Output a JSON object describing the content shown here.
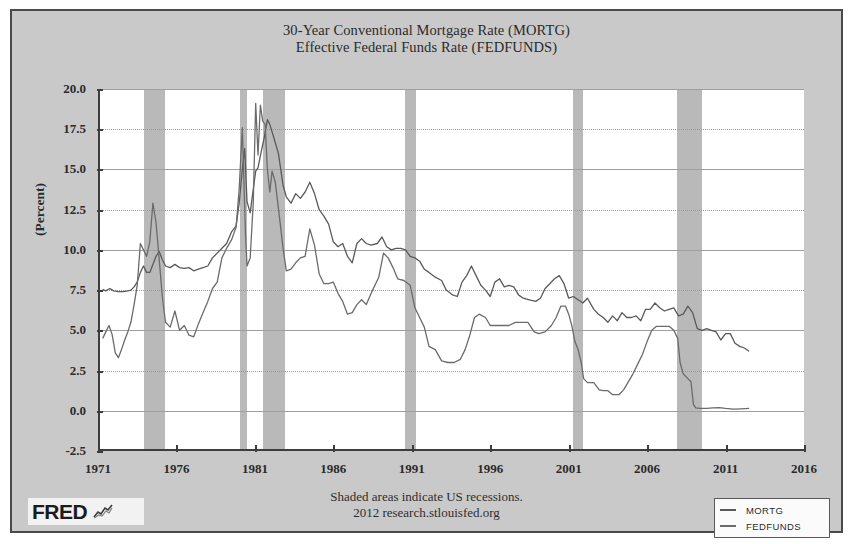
{
  "chart_data": {
    "type": "line",
    "title": "30-Year Conventional Mortgage Rate (MORTG)",
    "subtitle": "Effective Federal Funds Rate (FEDFUNDS)",
    "title_lines": [
      "30-Year Conventional Mortgage Rate (MORTG)",
      "Effective Federal Funds Rate (FEDFUNDS)"
    ],
    "xlabel": "",
    "ylabel": "(Percent)",
    "xlim": [
      1971.0,
      2016.0
    ],
    "ylim": [
      -2.5,
      20.0
    ],
    "grid": true,
    "legend_position": "bottom-right",
    "y_ticks": [
      "20.0",
      "17.5",
      "15.0",
      "12.5",
      "10.0",
      "7.5",
      "5.0",
      "2.5",
      "0.0",
      "-2.5"
    ],
    "y_tick_values": [
      20.0,
      17.5,
      15.0,
      12.5,
      10.0,
      7.5,
      5.0,
      2.5,
      0.0,
      -2.5
    ],
    "x_ticks": [
      "1971",
      "1976",
      "1981",
      "1986",
      "1991",
      "1996",
      "2001",
      "2006",
      "2011",
      "2016"
    ],
    "x_tick_values": [
      1971,
      1976,
      1981,
      1986,
      1991,
      1996,
      2001,
      2006,
      2011,
      2016
    ],
    "annotations": [
      "Shaded areas indicate US recessions.",
      "2012 research.stlouisfed.org"
    ],
    "recessions": [
      {
        "start": 1973.92,
        "end": 1975.25
      },
      {
        "start": 1980.08,
        "end": 1980.5
      },
      {
        "start": 1981.5,
        "end": 1982.92
      },
      {
        "start": 1990.58,
        "end": 1991.25
      },
      {
        "start": 2001.25,
        "end": 2001.92
      },
      {
        "start": 2007.92,
        "end": 2009.5
      }
    ],
    "series": [
      {
        "name": "MORTG",
        "color": "#5a5a5a",
        "x": [
          1971.3,
          1971.5,
          1971.75,
          1972.0,
          1972.3,
          1972.6,
          1972.9,
          1973.1,
          1973.3,
          1973.5,
          1973.7,
          1973.9,
          1974.1,
          1974.3,
          1974.5,
          1974.7,
          1974.9,
          1975.1,
          1975.3,
          1975.6,
          1975.9,
          1976.2,
          1976.5,
          1976.8,
          1977.1,
          1977.4,
          1977.7,
          1978.0,
          1978.3,
          1978.6,
          1978.9,
          1979.2,
          1979.5,
          1979.8,
          1980.0,
          1980.2,
          1980.35,
          1980.5,
          1980.7,
          1980.9,
          1981.05,
          1981.2,
          1981.4,
          1981.6,
          1981.8,
          1981.95,
          1982.2,
          1982.5,
          1982.8,
          1983.0,
          1983.3,
          1983.6,
          1983.9,
          1984.2,
          1984.5,
          1984.8,
          1985.1,
          1985.4,
          1985.7,
          1986.0,
          1986.3,
          1986.6,
          1986.9,
          1987.2,
          1987.5,
          1987.8,
          1988.1,
          1988.4,
          1988.8,
          1989.1,
          1989.4,
          1989.7,
          1990.0,
          1990.3,
          1990.6,
          1990.9,
          1991.2,
          1991.5,
          1991.8,
          1992.1,
          1992.5,
          1992.9,
          1993.2,
          1993.6,
          1993.9,
          1994.2,
          1994.5,
          1994.8,
          1995.1,
          1995.4,
          1995.7,
          1996.0,
          1996.3,
          1996.6,
          1996.9,
          1997.2,
          1997.5,
          1997.8,
          1998.1,
          1998.5,
          1998.9,
          1999.2,
          1999.5,
          1999.8,
          2000.1,
          2000.4,
          2000.7,
          2001.0,
          2001.3,
          2001.6,
          2001.9,
          2002.2,
          2002.6,
          2002.9,
          2003.2,
          2003.5,
          2003.8,
          2004.1,
          2004.4,
          2004.7,
          2005.0,
          2005.3,
          2005.6,
          2005.9,
          2006.2,
          2006.5,
          2006.8,
          2007.1,
          2007.4,
          2007.7,
          2008.0,
          2008.3,
          2008.6,
          2008.9,
          2009.2,
          2009.5,
          2009.8,
          2010.1,
          2010.4,
          2010.7,
          2011.0,
          2011.3,
          2011.6,
          2011.9,
          2012.2,
          2012.5
        ],
        "y": [
          7.55,
          7.45,
          7.6,
          7.45,
          7.4,
          7.4,
          7.45,
          7.5,
          7.7,
          8.0,
          8.6,
          9.0,
          8.6,
          8.6,
          9.1,
          9.6,
          9.9,
          9.4,
          9.0,
          8.9,
          9.1,
          8.9,
          8.85,
          8.9,
          8.7,
          8.8,
          8.9,
          9.0,
          9.5,
          9.8,
          10.1,
          10.4,
          11.1,
          11.5,
          12.9,
          15.0,
          16.3,
          13.0,
          12.3,
          13.8,
          14.9,
          15.1,
          16.1,
          17.0,
          18.1,
          17.8,
          17.0,
          16.0,
          14.0,
          13.3,
          12.9,
          13.5,
          13.2,
          13.6,
          14.2,
          13.5,
          12.5,
          12.1,
          11.6,
          10.5,
          10.2,
          10.4,
          9.6,
          9.2,
          10.4,
          10.7,
          10.4,
          10.3,
          10.4,
          10.8,
          10.2,
          10.0,
          10.1,
          10.1,
          10.0,
          9.6,
          9.5,
          9.3,
          8.8,
          8.6,
          8.3,
          8.1,
          7.5,
          7.2,
          7.1,
          8.0,
          8.4,
          9.0,
          8.4,
          7.8,
          7.5,
          7.1,
          8.0,
          8.2,
          7.7,
          7.8,
          7.7,
          7.2,
          7.0,
          6.9,
          6.8,
          7.0,
          7.6,
          7.9,
          8.2,
          8.4,
          7.9,
          7.0,
          7.1,
          6.9,
          6.7,
          7.0,
          6.3,
          6.0,
          5.8,
          5.5,
          5.9,
          5.6,
          6.1,
          5.8,
          5.8,
          5.9,
          5.6,
          6.3,
          6.3,
          6.7,
          6.4,
          6.2,
          6.3,
          6.4,
          5.9,
          6.0,
          6.5,
          6.1,
          5.1,
          5.0,
          5.1,
          5.0,
          4.9,
          4.4,
          4.8,
          4.8,
          4.2,
          4.0,
          3.9,
          3.7
        ],
        "start_value": 7.55,
        "end_value": 3.7,
        "max_value": 18.1,
        "min_value": 3.7
      },
      {
        "name": "FEDFUNDS",
        "color": "#6b6b6b",
        "x": [
          1971.3,
          1971.5,
          1971.7,
          1971.9,
          1972.1,
          1972.3,
          1972.5,
          1972.7,
          1972.9,
          1973.1,
          1973.3,
          1973.5,
          1973.7,
          1973.9,
          1974.1,
          1974.3,
          1974.5,
          1974.7,
          1974.9,
          1975.1,
          1975.3,
          1975.6,
          1975.9,
          1976.2,
          1976.5,
          1976.8,
          1977.1,
          1977.4,
          1977.7,
          1978.0,
          1978.3,
          1978.6,
          1978.9,
          1979.2,
          1979.5,
          1979.8,
          1980.0,
          1980.2,
          1980.4,
          1980.5,
          1980.7,
          1980.9,
          1981.05,
          1981.2,
          1981.35,
          1981.5,
          1981.65,
          1981.8,
          1981.95,
          1982.1,
          1982.3,
          1982.5,
          1982.8,
          1983.0,
          1983.3,
          1983.6,
          1983.9,
          1984.2,
          1984.5,
          1984.8,
          1985.1,
          1985.4,
          1985.7,
          1986.0,
          1986.3,
          1986.6,
          1986.9,
          1987.2,
          1987.5,
          1987.8,
          1988.1,
          1988.5,
          1988.9,
          1989.2,
          1989.5,
          1989.8,
          1990.1,
          1990.5,
          1990.9,
          1991.2,
          1991.5,
          1991.8,
          1992.1,
          1992.5,
          1992.9,
          1993.3,
          1993.7,
          1994.1,
          1994.4,
          1994.7,
          1995.0,
          1995.3,
          1995.7,
          1996.0,
          1996.4,
          1996.8,
          1997.2,
          1997.6,
          1998.0,
          1998.4,
          1998.8,
          1999.1,
          1999.5,
          1999.9,
          2000.2,
          2000.5,
          2000.8,
          2001.0,
          2001.2,
          2001.4,
          2001.6,
          2001.8,
          2001.95,
          2002.2,
          2002.6,
          2002.95,
          2003.2,
          2003.5,
          2003.8,
          2004.2,
          2004.5,
          2004.8,
          2005.1,
          2005.4,
          2005.7,
          2006.0,
          2006.3,
          2006.6,
          2007.0,
          2007.4,
          2007.7,
          2007.95,
          2008.1,
          2008.3,
          2008.6,
          2008.8,
          2008.95,
          2009.1,
          2009.4,
          2009.8,
          2010.2,
          2010.6,
          2011.0,
          2011.5,
          2012.0,
          2012.5
        ],
        "y": [
          4.5,
          4.9,
          5.3,
          4.75,
          3.6,
          3.3,
          3.8,
          4.4,
          4.9,
          5.5,
          6.6,
          7.8,
          10.4,
          10.0,
          9.6,
          10.5,
          12.9,
          11.7,
          9.4,
          7.1,
          5.5,
          5.2,
          6.2,
          5.0,
          5.3,
          4.7,
          4.6,
          5.4,
          6.1,
          6.8,
          7.6,
          8.0,
          9.5,
          10.1,
          10.6,
          11.4,
          13.8,
          17.6,
          11.0,
          9.0,
          9.5,
          13.0,
          19.1,
          15.9,
          19.0,
          18.0,
          17.8,
          15.0,
          13.6,
          14.9,
          14.2,
          12.6,
          10.1,
          8.7,
          8.8,
          9.2,
          9.5,
          9.6,
          11.3,
          10.3,
          8.5,
          7.9,
          7.9,
          8.0,
          7.3,
          6.8,
          6.0,
          6.1,
          6.6,
          6.9,
          6.6,
          7.5,
          8.3,
          9.8,
          9.5,
          8.9,
          8.2,
          8.1,
          7.8,
          6.4,
          5.8,
          5.2,
          4.0,
          3.8,
          3.1,
          3.0,
          3.0,
          3.2,
          3.8,
          4.7,
          5.8,
          6.0,
          5.8,
          5.3,
          5.3,
          5.3,
          5.3,
          5.5,
          5.5,
          5.5,
          4.9,
          4.8,
          4.9,
          5.3,
          5.8,
          6.5,
          6.5,
          6.0,
          5.3,
          4.3,
          3.8,
          3.0,
          2.0,
          1.75,
          1.75,
          1.3,
          1.25,
          1.25,
          1.0,
          1.0,
          1.3,
          1.8,
          2.3,
          2.9,
          3.5,
          4.3,
          5.0,
          5.25,
          5.25,
          5.25,
          5.0,
          4.5,
          3.0,
          2.3,
          2.0,
          1.8,
          0.4,
          0.18,
          0.15,
          0.15,
          0.18,
          0.2,
          0.15,
          0.1,
          0.12,
          0.15
        ],
        "start_value": 4.5,
        "end_value": 0.15,
        "max_value": 19.1,
        "min_value": 0.1
      }
    ]
  },
  "footer": {
    "line1": "Shaded areas indicate US recessions.",
    "line2": "2012 research.stlouisfed.org"
  },
  "logo": {
    "word": "FRED",
    "mark": "chart-squiggle-icon"
  },
  "legend": {
    "items": [
      {
        "label": "MORTG",
        "color": "#5a5a5a"
      },
      {
        "label": "FEDFUNDS",
        "color": "#6b6b6b"
      }
    ]
  },
  "colors": {
    "figure_background": "#c9c9c9",
    "plot_background": "#ffffff",
    "recession_band": "#b9b9b9",
    "axis": "#3d3d3d",
    "gridline": "#9a9a9a",
    "mortg_line": "#5a5a5a",
    "fedfunds_line": "#6b6b6b",
    "text": "#2b2b2b"
  }
}
